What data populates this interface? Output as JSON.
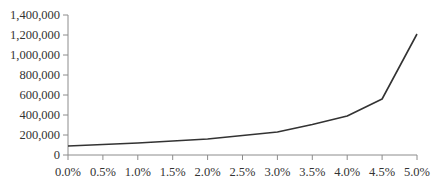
{
  "chart_data": {
    "type": "line",
    "title": "",
    "xlabel": "",
    "ylabel": "",
    "categories": [
      "0.0%",
      "0.5%",
      "1.0%",
      "1.5%",
      "2.0%",
      "2.5%",
      "3.0%",
      "3.5%",
      "4.0%",
      "4.5%",
      "5.0%"
    ],
    "series": [
      {
        "name": "Series 1",
        "values": [
          90000,
          105000,
          120000,
          140000,
          160000,
          195000,
          230000,
          305000,
          390000,
          560000,
          1210000
        ],
        "color": "#333333"
      }
    ],
    "ylim": [
      0,
      1400000
    ],
    "yticks": [
      0,
      200000,
      400000,
      600000,
      800000,
      1000000,
      1200000,
      1400000
    ],
    "ytick_labels": [
      "0",
      "200,000",
      "400,000",
      "600,000",
      "800,000",
      "1,000,000",
      "1,200,000",
      "1,400,000"
    ],
    "grid": false,
    "legend": null
  },
  "colors": {
    "axis": "#8c8c8c",
    "line": "#333333",
    "text": "#333333",
    "background": "#ffffff"
  }
}
